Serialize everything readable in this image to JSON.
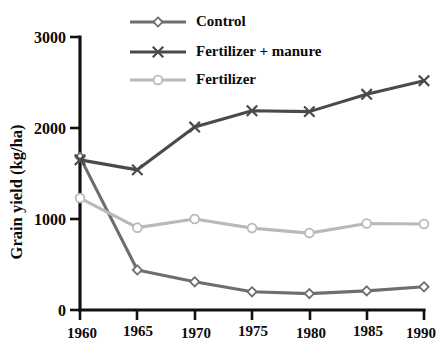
{
  "chart_data": {
    "type": "line",
    "title": "",
    "xlabel": "",
    "ylabel": "Grain yield (kg/ha)",
    "x": [
      1960,
      1965,
      1970,
      1975,
      1980,
      1985,
      1990
    ],
    "xtick_labels": [
      "1960",
      "1965",
      "1970",
      "1975",
      "1980",
      "1985",
      "1990"
    ],
    "ytick_labels": [
      "0",
      "1000",
      "2000",
      "3000"
    ],
    "yticks": [
      0,
      1000,
      2000,
      3000
    ],
    "xlim": [
      1960,
      1990
    ],
    "ylim": [
      0,
      3000
    ],
    "grid": false,
    "legend_position": "top-center",
    "series": [
      {
        "name": "Control",
        "marker": "diamond",
        "color": "#6e6e6e",
        "values": [
          1680,
          440,
          310,
          200,
          180,
          210,
          255
        ]
      },
      {
        "name": "Fertilizer + manure",
        "marker": "x",
        "color": "#4a4a4a",
        "values": [
          1650,
          1540,
          2010,
          2190,
          2180,
          2370,
          2520
        ]
      },
      {
        "name": "Fertilizer",
        "marker": "circle",
        "color": "#b9b9b9",
        "values": [
          1230,
          905,
          1000,
          900,
          845,
          950,
          945
        ]
      }
    ]
  },
  "legend": {
    "items": [
      {
        "label": "Control"
      },
      {
        "label": "Fertilizer + manure"
      },
      {
        "label": "Fertilizer"
      }
    ]
  },
  "axes": {
    "y_title": "Grain yield (kg/ha)"
  }
}
